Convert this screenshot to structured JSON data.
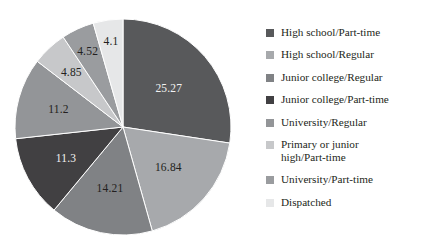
{
  "chart_data": {
    "type": "pie",
    "title": "",
    "subtitle": "",
    "xlabel": "",
    "ylabel": "",
    "legend_position": "right",
    "grid": false,
    "start_angle_deg": 0,
    "direction": "clockwise",
    "categories": [
      "High school/Part-time",
      "High school/Regular",
      "Junior college/Regular",
      "Junior college/Part-time",
      "University/Regular",
      "Primary or junior high/Part-time",
      "University/Part-time",
      "Dispatched"
    ],
    "values": [
      25.27,
      16.84,
      14.21,
      11.3,
      11.2,
      4.85,
      4.52,
      4.1
    ],
    "value_labels": [
      "25.27",
      "16.84",
      "14.21",
      "11.3",
      "11.2",
      "4.85",
      "4.52",
      "4.1"
    ],
    "colors": [
      "#58595b",
      "#a7a9ac",
      "#808285",
      "#414042",
      "#939598",
      "#c7c8ca",
      "#9a9c9f",
      "#e6e7e8"
    ],
    "label_text_colors": [
      "#f2f2f2",
      "#231f20",
      "#231f20",
      "#f2f2f2",
      "#231f20",
      "#231f20",
      "#231f20",
      "#231f20"
    ],
    "total": 92.29
  },
  "legend": {
    "items": [
      {
        "label": "High school/Part-time",
        "color": "#58595b"
      },
      {
        "label": "High school/Regular",
        "color": "#a7a9ac"
      },
      {
        "label": "Junior college/Regular",
        "color": "#808285"
      },
      {
        "label": "Junior college/Part-time",
        "color": "#414042"
      },
      {
        "label": "University/Regular",
        "color": "#939598"
      },
      {
        "label": "Primary or junior\nhigh/Part-time",
        "color": "#c7c8ca"
      },
      {
        "label": "University/Part-time",
        "color": "#9a9c9f"
      },
      {
        "label": "Dispatched",
        "color": "#e6e7e8"
      }
    ]
  },
  "theme": {
    "background": "#ffffff",
    "text_color": "#231f20"
  }
}
